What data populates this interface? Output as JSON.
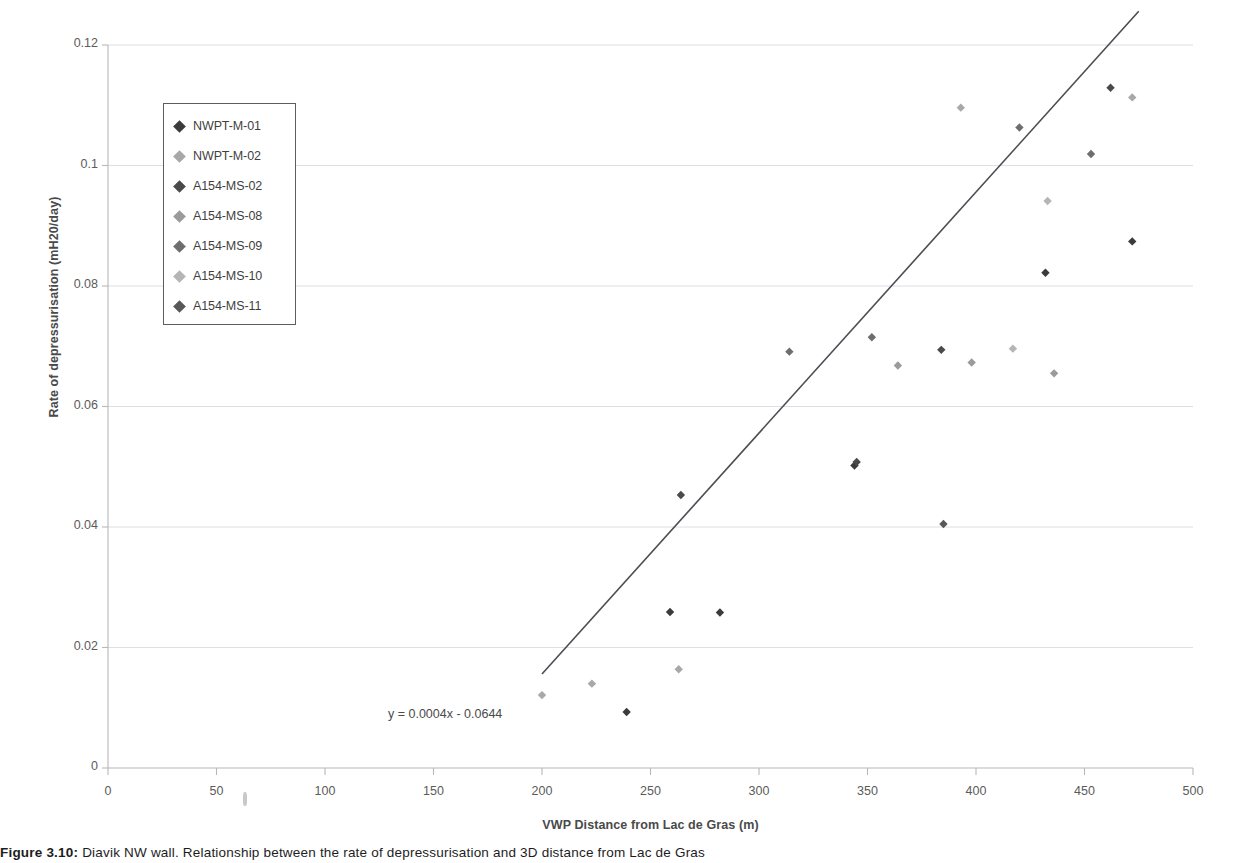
{
  "figure": {
    "caption_prefix": "Figure 3.10:",
    "caption_text": " Diavik NW wall. Relationship between the rate of depressurisation and 3D distance from Lac de Gras"
  },
  "axes": {
    "x_title": "VWP Distance  from Lac de Gras (m)",
    "y_title": "Rate of depressurisation (mH20/day)",
    "x_ticks": [
      "0",
      "50",
      "100",
      "150",
      "200",
      "250",
      "300",
      "350",
      "400",
      "450",
      "500"
    ],
    "y_ticks": [
      "0",
      "0.02",
      "0.04",
      "0.06",
      "0.08",
      "0.1",
      "0.12"
    ]
  },
  "annotations": {
    "trendline_equation": "y = 0.0004x - 0.0644"
  },
  "colors": {
    "series_1": "#3b3b3b",
    "series_2": "#a8a8a8",
    "series_3": "#4a4a4a",
    "series_4": "#9b9b9b",
    "series_5": "#6e6e6e",
    "series_6": "#b5b5b5",
    "series_7": "#585858",
    "trendline": "#4c4c52",
    "gridline": "#dedee6",
    "axis": "#b8b8b8",
    "legend_border": "#5d5d5d"
  },
  "chart_data": {
    "type": "scatter",
    "title": "",
    "xlabel": "VWP Distance  from Lac de Gras (m)",
    "ylabel": "Rate of depressurisation (mH20/day)",
    "xlim": [
      0,
      500
    ],
    "ylim": [
      0,
      0.12
    ],
    "xticks": [
      0,
      50,
      100,
      150,
      200,
      250,
      300,
      350,
      400,
      450,
      500
    ],
    "yticks": [
      0,
      0.02,
      0.04,
      0.06,
      0.08,
      0.1,
      0.12
    ],
    "grid": "horizontal",
    "legend_position": "inside-upper-left",
    "series": [
      {
        "name": "NWPT-M-01",
        "color": "#3b3b3b",
        "points": [
          {
            "x": 239,
            "y": 0.0093
          },
          {
            "x": 259,
            "y": 0.0259
          },
          {
            "x": 282,
            "y": 0.0258
          },
          {
            "x": 344,
            "y": 0.0502
          },
          {
            "x": 432,
            "y": 0.0822
          },
          {
            "x": 472,
            "y": 0.0874
          }
        ]
      },
      {
        "name": "NWPT-M-02",
        "color": "#a8a8a8",
        "points": [
          {
            "x": 200,
            "y": 0.0121
          },
          {
            "x": 223,
            "y": 0.014
          },
          {
            "x": 263,
            "y": 0.0164
          },
          {
            "x": 393,
            "y": 0.1096
          },
          {
            "x": 472,
            "y": 0.1113
          }
        ]
      },
      {
        "name": "A154-MS-02",
        "color": "#4a4a4a",
        "points": [
          {
            "x": 264,
            "y": 0.0453
          },
          {
            "x": 345,
            "y": 0.0508
          },
          {
            "x": 384,
            "y": 0.0694
          },
          {
            "x": 462,
            "y": 0.1129
          }
        ]
      },
      {
        "name": "A154-MS-08",
        "color": "#9b9b9b",
        "points": [
          {
            "x": 364,
            "y": 0.0668
          },
          {
            "x": 398,
            "y": 0.0673
          },
          {
            "x": 436,
            "y": 0.0655
          }
        ]
      },
      {
        "name": "A154-MS-09",
        "color": "#6e6e6e",
        "points": [
          {
            "x": 314,
            "y": 0.0691
          },
          {
            "x": 352,
            "y": 0.0715
          },
          {
            "x": 420,
            "y": 0.1063
          },
          {
            "x": 453,
            "y": 0.1019
          }
        ]
      },
      {
        "name": "A154-MS-10",
        "color": "#b5b5b5",
        "points": [
          {
            "x": 417,
            "y": 0.0696
          },
          {
            "x": 433,
            "y": 0.0941
          }
        ]
      },
      {
        "name": "A154-MS-11",
        "color": "#585858",
        "points": [
          {
            "x": 385,
            "y": 0.0405
          }
        ]
      }
    ],
    "trendline": {
      "equation": "y = 0.0004x - 0.0644",
      "slope": 0.0004,
      "intercept": -0.0644,
      "x_start": 200,
      "x_end": 475
    }
  }
}
